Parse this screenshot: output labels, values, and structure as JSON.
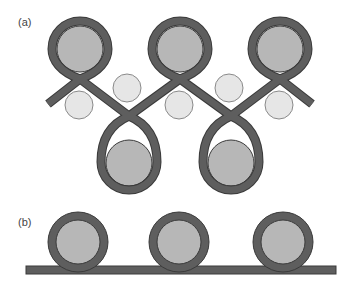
{
  "panels": {
    "a": {
      "label": "(a)"
    },
    "b": {
      "label": "(b)"
    }
  },
  "colors": {
    "band": "#5e5e5e",
    "band_edge": "#3a3a3a",
    "large_roller": "#b7b7b7",
    "small_roller": "#e6e6e6",
    "small_roller_edge": "#8a8a8a"
  }
}
